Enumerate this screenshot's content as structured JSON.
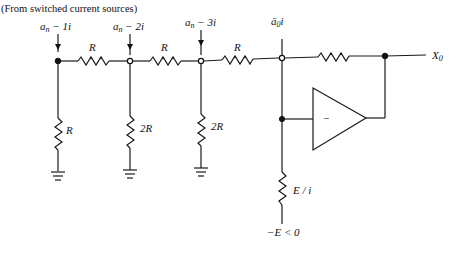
{
  "caption": "(From switched current sources)",
  "inputs": [
    {
      "id": "in1",
      "label_base": "a",
      "label_sub": "n",
      "label_rest": " − 1i",
      "node": "filled"
    },
    {
      "id": "in2",
      "label_base": "a",
      "label_sub": "n",
      "label_rest": " − 2i",
      "node": "open"
    },
    {
      "id": "in3",
      "label_base": "a",
      "label_sub": "n",
      "label_rest": " − 3i",
      "node": "open"
    },
    {
      "id": "in0",
      "label_base": "ā",
      "label_sub": "0",
      "label_rest": "i",
      "node": "open"
    }
  ],
  "series_resistors": [
    {
      "label": "R"
    },
    {
      "label": "R"
    },
    {
      "label": "R"
    }
  ],
  "feedback_resistor": {
    "label": ""
  },
  "shunt_resistors": [
    {
      "label": "R"
    },
    {
      "label": "2R"
    },
    {
      "label": "2R"
    }
  ],
  "opamp": {
    "input_sign": "−"
  },
  "bias_resistor": {
    "label": "E / i"
  },
  "supply_label": "−E < 0",
  "output": {
    "label_base": "X",
    "label_sub": "0"
  }
}
